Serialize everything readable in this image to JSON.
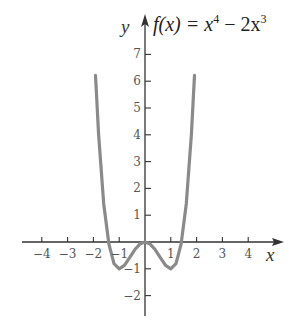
{
  "chart_data": {
    "type": "line",
    "title_parts": {
      "lhs": "f(x) = x",
      "exp1": "4",
      "mid": " − 2x",
      "exp2": "3"
    },
    "xlabel": "x",
    "ylabel": "y",
    "xlim": [
      -4.6,
      5
    ],
    "ylim": [
      -2.8,
      8
    ],
    "x_ticks": [
      -4,
      -3,
      -2,
      -1,
      1,
      2,
      3,
      4
    ],
    "x_tick_labels": [
      "−4",
      "−3",
      "−2",
      "−1",
      "1",
      "2",
      "3",
      "4"
    ],
    "y_ticks": [
      -2,
      -1,
      1,
      2,
      3,
      4,
      5,
      6,
      7
    ],
    "y_tick_labels": [
      "−2",
      "−1",
      "1",
      "2",
      "3",
      "4",
      "5",
      "6",
      "7"
    ],
    "grid": false,
    "legend": null,
    "series": [
      {
        "name": "f(x)",
        "color": "#8a8a8a",
        "x": [
          -1.92,
          -1.8,
          -1.6,
          -1.4,
          -1.2,
          -1.0,
          -0.8,
          -0.6,
          -0.4,
          -0.2,
          0,
          0.2,
          0.4,
          0.6,
          0.8,
          1.0,
          1.2,
          1.4,
          1.6,
          1.8,
          1.92
        ],
        "y": [
          6.22,
          4.02,
          1.43,
          -0.08,
          -0.81,
          -1.0,
          -0.87,
          -0.59,
          -0.29,
          -0.08,
          0,
          -0.08,
          -0.29,
          -0.59,
          -0.87,
          -1.0,
          -0.81,
          -0.08,
          1.43,
          4.02,
          6.22
        ]
      }
    ],
    "annotations": []
  },
  "colors": {
    "axis": "#333333",
    "curve": "#8a8a8a",
    "background": "#ffffff"
  }
}
